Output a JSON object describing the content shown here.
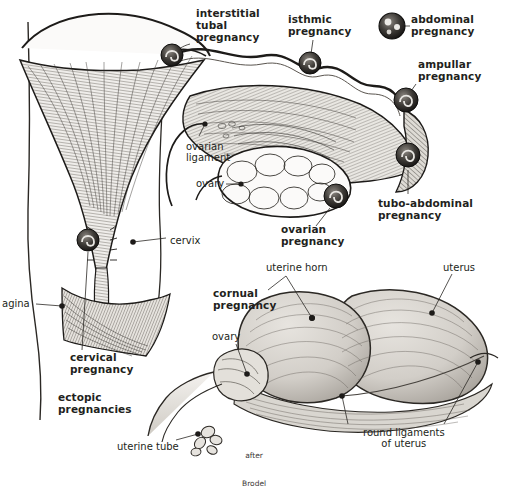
{
  "figure": {
    "title": "ectopic pregnancies",
    "attribution": "after\nBrodel",
    "background_color": "#ffffff",
    "ink_color": "#231f20",
    "tissue_fill": "#d8d5d0"
  },
  "pregnancy_site_labels": [
    {
      "id": "interstitial-tubal",
      "text": "interstitial\ntubal\npregnancy",
      "style": "bold",
      "x": 196,
      "y": 8,
      "align": "left"
    },
    {
      "id": "isthmic",
      "text": "isthmic\npregnancy",
      "style": "bold",
      "x": 288,
      "y": 14,
      "align": "left"
    },
    {
      "id": "abdominal",
      "text": "abdominal\npregnancy",
      "style": "bold",
      "x": 411,
      "y": 14,
      "align": "left"
    },
    {
      "id": "ampullar",
      "text": "ampullar\npregnancy",
      "style": "bold",
      "x": 418,
      "y": 59,
      "align": "left"
    },
    {
      "id": "tubo-abdominal",
      "text": "tubo-abdominal\npregnancy",
      "style": "bold",
      "x": 378,
      "y": 198,
      "align": "left"
    },
    {
      "id": "ovarian",
      "text": "ovarian\npregnancy",
      "style": "bold",
      "x": 281,
      "y": 224,
      "align": "left"
    },
    {
      "id": "cervical",
      "text": "cervical\npregnancy",
      "style": "bold",
      "x": 70,
      "y": 352,
      "align": "left"
    },
    {
      "id": "cornual",
      "text": "cornual\npregnancy",
      "style": "bold",
      "x": 213,
      "y": 288,
      "align": "left"
    }
  ],
  "anatomy_labels": [
    {
      "id": "ovarian-ligament",
      "text": "ovarian\nligament",
      "style": "plain",
      "x": 186,
      "y": 141,
      "align": "left"
    },
    {
      "id": "ovary-upper",
      "text": "ovary",
      "style": "plain",
      "x": 196,
      "y": 178,
      "align": "left"
    },
    {
      "id": "cervix",
      "text": "cervix",
      "style": "plain",
      "x": 170,
      "y": 235,
      "align": "left"
    },
    {
      "id": "vagina",
      "text": "agina",
      "style": "plain",
      "x": 2,
      "y": 298,
      "align": "left"
    },
    {
      "id": "uterine-horn",
      "text": "uterine horn",
      "style": "plain",
      "x": 266,
      "y": 262,
      "align": "left"
    },
    {
      "id": "uterus",
      "text": "uterus",
      "style": "plain",
      "x": 443,
      "y": 262,
      "align": "left"
    },
    {
      "id": "ovary-lower",
      "text": "ovary",
      "style": "plain",
      "x": 212,
      "y": 331,
      "align": "left"
    },
    {
      "id": "uterine-tube",
      "text": "uterine tube",
      "style": "plain",
      "x": 117,
      "y": 441,
      "align": "left"
    },
    {
      "id": "round-ligaments",
      "text": "round ligaments\nof uterus",
      "style": "plain",
      "x": 363,
      "y": 427,
      "align": "left"
    }
  ],
  "caption": {
    "id": "ectopic-pregnancies",
    "text": "ectopic\npregnancies",
    "x": 58,
    "y": 392
  },
  "credit": {
    "id": "after-brodel",
    "line1": "after",
    "line2": "Brodel",
    "x": 242,
    "y": 432
  },
  "embryo_markers": [
    {
      "id": "marker-interstitial",
      "cx": 172,
      "cy": 55,
      "r": 11
    },
    {
      "id": "marker-isthmic",
      "cx": 310,
      "cy": 63,
      "r": 11
    },
    {
      "id": "marker-abdominal-free",
      "cx": 392,
      "cy": 26,
      "r": 13
    },
    {
      "id": "marker-ampullar",
      "cx": 406,
      "cy": 100,
      "r": 12
    },
    {
      "id": "marker-tubo-abdominal",
      "cx": 408,
      "cy": 155,
      "r": 12
    },
    {
      "id": "marker-ovarian",
      "cx": 336,
      "cy": 196,
      "r": 12
    },
    {
      "id": "marker-cervical",
      "cx": 88,
      "cy": 240,
      "r": 11
    }
  ],
  "leader_dots": [
    {
      "id": "dot-ovarian-ligament",
      "cx": 205,
      "cy": 124
    },
    {
      "id": "dot-ovary-upper",
      "cx": 241,
      "cy": 184
    },
    {
      "id": "dot-cervix",
      "cx": 133,
      "cy": 242
    },
    {
      "id": "dot-vagina",
      "cx": 62,
      "cy": 306
    },
    {
      "id": "dot-uterine-horn",
      "cx": 312,
      "cy": 318
    },
    {
      "id": "dot-uterus",
      "cx": 432,
      "cy": 313
    },
    {
      "id": "dot-ovary-lower",
      "cx": 247,
      "cy": 374
    },
    {
      "id": "dot-round-ligament-a",
      "cx": 342,
      "cy": 396
    },
    {
      "id": "dot-round-ligament-b",
      "cx": 478,
      "cy": 362
    },
    {
      "id": "dot-uterine-tube",
      "cx": 198,
      "cy": 434
    }
  ]
}
